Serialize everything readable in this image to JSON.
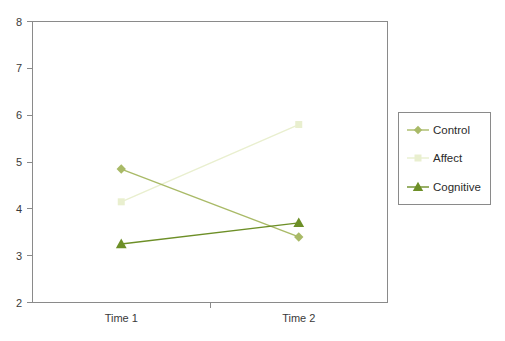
{
  "chart_data": {
    "type": "line",
    "title": "",
    "xlabel": "",
    "ylabel": "",
    "categories": [
      "Time 1",
      "Time 2"
    ],
    "x_tick_labels": [
      "Time 1",
      "Time 2"
    ],
    "y_tick_labels": [
      "2",
      "3",
      "4",
      "5",
      "6",
      "7",
      "8"
    ],
    "y_ticks": [
      2,
      3,
      4,
      5,
      6,
      7,
      8
    ],
    "ylim": [
      2,
      8
    ],
    "grid": false,
    "legend_position": "right-outside",
    "series": [
      {
        "name": "Control",
        "values": [
          4.85,
          3.4
        ],
        "color": "#a9ba67",
        "marker": "diamond"
      },
      {
        "name": "Affect",
        "values": [
          4.15,
          5.8
        ],
        "color": "#e9efcf",
        "marker": "square"
      },
      {
        "name": "Cognitive",
        "values": [
          3.25,
          3.7
        ],
        "color": "#6d8f27",
        "marker": "triangle"
      }
    ]
  },
  "legend": {
    "entries": [
      {
        "label": "Control"
      },
      {
        "label": "Affect"
      },
      {
        "label": "Cognitive"
      }
    ]
  },
  "axes": {
    "y_labels": {
      "t8": "8",
      "t7": "7",
      "t6": "6",
      "t5": "5",
      "t4": "4",
      "t3": "3",
      "t2": "2"
    },
    "x_labels": {
      "time1": "Time 1",
      "time2": "Time 2"
    }
  },
  "colors": {
    "control": "#a9ba67",
    "affect": "#e9efcf",
    "cognitive": "#6d8f27",
    "axis": "#8a8a8a",
    "text": "#3a3a3a",
    "background": "#ffffff"
  }
}
